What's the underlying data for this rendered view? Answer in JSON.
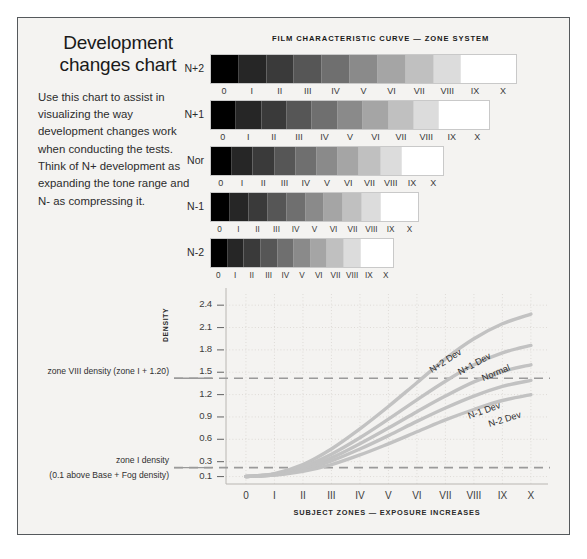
{
  "intro": {
    "heading": "Development changes chart",
    "body": "Use this chart to assist in visualizing the way development changes work when conducting the tests. Think of N+ development as expanding the tone range and N- as compressing it."
  },
  "strips": {
    "title": "FILM CHARACTERISTIC CURVE — ZONE SYSTEM",
    "zone_labels": [
      "0",
      "I",
      "II",
      "III",
      "IV",
      "V",
      "VI",
      "VII",
      "VIII",
      "IX",
      "X"
    ],
    "rows": [
      {
        "label": "N+2",
        "width": 307
      },
      {
        "label": "N+1",
        "width": 280
      },
      {
        "label": "Nor",
        "width": 234
      },
      {
        "label": "N-1",
        "width": 209
      },
      {
        "label": "N-2",
        "width": 184
      }
    ],
    "ramp": [
      "#000000",
      "#262626",
      "#3a3a3a",
      "#565656",
      "#6f6f6f",
      "#8a8a8a",
      "#a5a5a5",
      "#c0c0c0",
      "#dcdcdc",
      "#ffffff",
      "#ffffff"
    ]
  },
  "chart_data": {
    "type": "line",
    "title": "",
    "xlabel": "SUBJECT ZONES — EXPOSURE INCREASES",
    "ylabel": "DENSITY",
    "grid": true,
    "legend_position": "inline-on-curve",
    "categories": [
      "0",
      "I",
      "II",
      "III",
      "IV",
      "V",
      "VI",
      "VII",
      "VIII",
      "IX",
      "X"
    ],
    "x": [
      0,
      1,
      2,
      3,
      4,
      5,
      6,
      7,
      8,
      9,
      10
    ],
    "yticks": [
      "0.1",
      "0.3",
      "0.6",
      "0.9",
      "1.2",
      "1.5",
      "1.8",
      "2.1",
      "2.4"
    ],
    "ytickvals": [
      0.1,
      0.3,
      0.6,
      0.9,
      1.2,
      1.5,
      1.8,
      2.1,
      2.4
    ],
    "ylim": [
      0.0,
      2.55
    ],
    "xlim": [
      -0.7,
      10.6
    ],
    "series": [
      {
        "name": "N+2 Dev",
        "values": [
          0.1,
          0.14,
          0.26,
          0.47,
          0.74,
          1.04,
          1.36,
          1.68,
          1.95,
          2.15,
          2.28
        ]
      },
      {
        "name": "N+1 Dev",
        "values": [
          0.1,
          0.13,
          0.23,
          0.4,
          0.62,
          0.87,
          1.13,
          1.38,
          1.6,
          1.76,
          1.86
        ]
      },
      {
        "name": "Normal",
        "values": [
          0.1,
          0.13,
          0.21,
          0.35,
          0.54,
          0.75,
          0.97,
          1.18,
          1.37,
          1.51,
          1.6
        ]
      },
      {
        "name": "N-1 Dev",
        "values": [
          0.1,
          0.12,
          0.19,
          0.31,
          0.47,
          0.65,
          0.84,
          1.02,
          1.18,
          1.31,
          1.39
        ]
      },
      {
        "name": "N-2 Dev",
        "values": [
          0.1,
          0.12,
          0.17,
          0.26,
          0.39,
          0.54,
          0.7,
          0.86,
          1.0,
          1.12,
          1.2
        ]
      }
    ],
    "reference_lines": [
      {
        "value": 1.42,
        "caption_line1": "zone VIII density (zone I + 1.20)",
        "caption_line2": ""
      },
      {
        "value": 0.22,
        "caption_line1": "zone I density",
        "caption_line2": "(0.1 above Base + Fog density)"
      }
    ],
    "colors": {
      "curve": "#c2c2c2",
      "grid": "#dedbd7",
      "reference": "#9a9a9a",
      "axis": "#b9b6b2"
    }
  }
}
